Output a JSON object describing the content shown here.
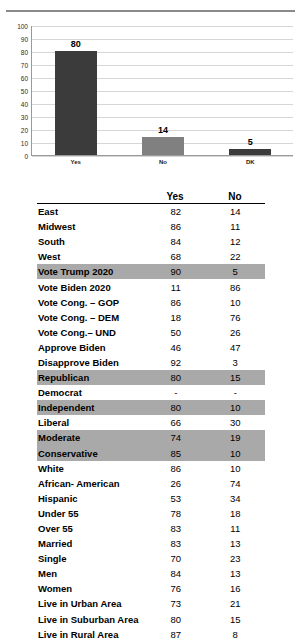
{
  "chart_data": {
    "type": "bar",
    "title": "",
    "xlabel": "",
    "ylabel": "",
    "categories": [
      "Yes",
      "No",
      "DK"
    ],
    "values": [
      80,
      14,
      5
    ],
    "ylim": [
      0,
      100
    ],
    "yticks": [
      100,
      90,
      80,
      70,
      60,
      50,
      40,
      30,
      20,
      10,
      0
    ],
    "grid": true,
    "legend": "none",
    "bar_colors": [
      "#3b3b3b",
      "#808080",
      "#3b3b3b"
    ]
  },
  "table": {
    "columns": [
      "",
      "Yes",
      "No"
    ],
    "header_yes": "Yes",
    "header_no": "No",
    "highlight_color": "#a9a9a9",
    "rows": [
      {
        "label": "East",
        "yes": "82",
        "no": "14",
        "highlight": false
      },
      {
        "label": "Midwest",
        "yes": "86",
        "no": "11",
        "highlight": false
      },
      {
        "label": "South",
        "yes": "84",
        "no": "12",
        "highlight": false
      },
      {
        "label": "West",
        "yes": "68",
        "no": "22",
        "highlight": false
      },
      {
        "label": "Vote Trump 2020",
        "yes": "90",
        "no": "5",
        "highlight": true
      },
      {
        "label": "Vote Biden 2020",
        "yes": "11",
        "no": "86",
        "highlight": false
      },
      {
        "label": "Vote Cong. – GOP",
        "yes": "86",
        "no": "10",
        "highlight": false
      },
      {
        "label": "Vote Cong. – DEM",
        "yes": "18",
        "no": "76",
        "highlight": false
      },
      {
        "label": "Vote Cong.– UND",
        "yes": "50",
        "no": "26",
        "highlight": false
      },
      {
        "label": "Approve Biden",
        "yes": "46",
        "no": "47",
        "highlight": false
      },
      {
        "label": "Disapprove Biden",
        "yes": "92",
        "no": "3",
        "highlight": false
      },
      {
        "label": "Republican",
        "yes": "80",
        "no": "15",
        "highlight": true
      },
      {
        "label": "Democrat",
        "yes": "-",
        "no": "-",
        "highlight": false
      },
      {
        "label": "Independent",
        "yes": "80",
        "no": "10",
        "highlight": true
      },
      {
        "label": "Liberal",
        "yes": "66",
        "no": "30",
        "highlight": false
      },
      {
        "label": "Moderate",
        "yes": "74",
        "no": "19",
        "highlight": true
      },
      {
        "label": "Conservative",
        "yes": "85",
        "no": "10",
        "highlight": true
      },
      {
        "label": "White",
        "yes": "86",
        "no": "10",
        "highlight": false
      },
      {
        "label": "African- American",
        "yes": "26",
        "no": "74",
        "highlight": false
      },
      {
        "label": "Hispanic",
        "yes": "53",
        "no": "34",
        "highlight": false
      },
      {
        "label": "Under 55",
        "yes": "78",
        "no": "18",
        "highlight": false
      },
      {
        "label": "Over 55",
        "yes": "83",
        "no": "11",
        "highlight": false
      },
      {
        "label": "Married",
        "yes": "83",
        "no": "13",
        "highlight": false
      },
      {
        "label": "Single",
        "yes": "70",
        "no": "23",
        "highlight": false
      },
      {
        "label": "Men",
        "yes": "84",
        "no": "13",
        "highlight": false
      },
      {
        "label": "Women",
        "yes": "76",
        "no": "16",
        "highlight": false
      },
      {
        "label": "Live in Urban Area",
        "yes": "73",
        "no": "21",
        "highlight": false
      },
      {
        "label": "Live in Suburban Area",
        "yes": "80",
        "no": "15",
        "highlight": false
      },
      {
        "label": "Live in Rural Area",
        "yes": "87",
        "no": "8",
        "highlight": false
      }
    ]
  }
}
